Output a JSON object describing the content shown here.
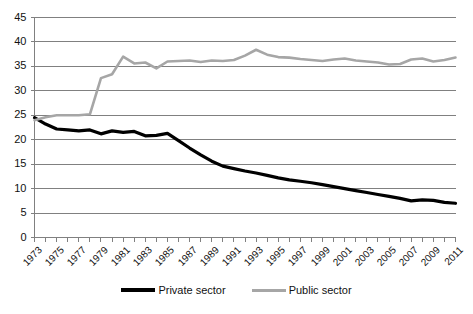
{
  "chart_data": {
    "type": "line",
    "title": "",
    "subtitle": "",
    "xlabel": "",
    "ylabel": "",
    "grid": true,
    "legend_position": "bottom",
    "xlim": [
      1973,
      2011
    ],
    "ylim": [
      0,
      45
    ],
    "ytick_values": [
      0,
      5,
      10,
      15,
      20,
      25,
      30,
      35,
      40,
      45
    ],
    "ytick_labels": [
      "0",
      "5",
      "10",
      "15",
      "20",
      "25",
      "30",
      "35",
      "40",
      "45"
    ],
    "x": [
      1973,
      1974,
      1975,
      1976,
      1977,
      1978,
      1979,
      1980,
      1981,
      1982,
      1983,
      1984,
      1985,
      1986,
      1987,
      1988,
      1989,
      1990,
      1991,
      1992,
      1993,
      1994,
      1995,
      1996,
      1997,
      1998,
      1999,
      2000,
      2001,
      2002,
      2003,
      2004,
      2005,
      2006,
      2007,
      2008,
      2009,
      2010,
      2011
    ],
    "xtick_labels": [
      "1973",
      "1975",
      "1977",
      "1979",
      "1981",
      "1983",
      "1985",
      "1987",
      "1989",
      "1991",
      "1993",
      "1995",
      "1997",
      "1999",
      "2001",
      "2003",
      "2005",
      "2007",
      "2009",
      "2011"
    ],
    "xtick_label_years": [
      1973,
      1975,
      1977,
      1979,
      1981,
      1983,
      1985,
      1987,
      1989,
      1991,
      1993,
      1995,
      1997,
      1999,
      2001,
      2003,
      2005,
      2007,
      2009,
      2011
    ],
    "series": [
      {
        "name": "Private sector",
        "color": "#000000",
        "width": 3.2,
        "values": [
          24.5,
          23.2,
          22.2,
          22.0,
          21.8,
          22.0,
          21.2,
          21.8,
          21.5,
          21.7,
          20.8,
          20.9,
          21.3,
          19.8,
          18.3,
          16.9,
          15.6,
          14.6,
          14.1,
          13.6,
          13.2,
          12.7,
          12.2,
          11.8,
          11.5,
          11.2,
          10.8,
          10.4,
          10.0,
          9.6,
          9.2,
          8.8,
          8.4,
          8.0,
          7.5,
          7.7,
          7.6,
          7.2,
          7.0
        ]
      },
      {
        "name": "Public sector",
        "color": "#a6a6a6",
        "width": 2.6,
        "values": [
          24.0,
          24.6,
          25.0,
          25.0,
          25.0,
          25.2,
          32.6,
          33.4,
          37.0,
          35.6,
          35.8,
          34.6,
          36.0,
          36.1,
          36.2,
          35.9,
          36.2,
          36.1,
          36.3,
          37.2,
          38.4,
          37.4,
          36.9,
          36.8,
          36.5,
          36.3,
          36.1,
          36.4,
          36.6,
          36.2,
          36.0,
          35.8,
          35.4,
          35.5,
          36.4,
          36.6,
          36.0,
          36.3,
          36.8
        ]
      }
    ]
  },
  "legend": {
    "items": [
      {
        "label": "Private sector",
        "key": "private"
      },
      {
        "label": "Public sector",
        "key": "public"
      }
    ]
  },
  "colors": {
    "private_sector": "#000000",
    "public_sector": "#a6a6a6",
    "gridline": "#808080",
    "axis": "#808080",
    "text": "#111111",
    "background": "#ffffff"
  }
}
